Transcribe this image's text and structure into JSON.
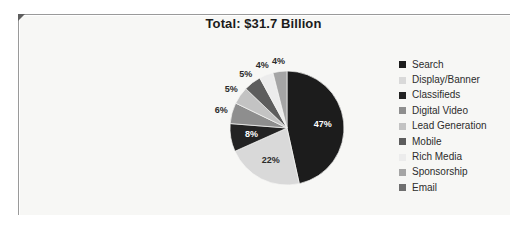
{
  "panel": {
    "background_color": "#f7f7f5",
    "page_background": "#ffffff"
  },
  "chart_data": {
    "type": "pie",
    "title": "Total: $31.7 Billion",
    "subtitle": "",
    "xlabel": "",
    "ylabel": "",
    "grid": false,
    "legend_position": "right",
    "start_angle_deg": 0,
    "direction": "clockwise",
    "categories": [
      "Search",
      "Display/Banner",
      "Classifieds",
      "Digital Video",
      "Lead Generation",
      "Mobile",
      "Rich Media",
      "Sponsorship",
      "Email"
    ],
    "values": [
      47,
      22,
      8,
      6,
      5,
      5,
      4,
      4,
      0
    ],
    "value_labels": [
      "47%",
      "22%",
      "8%",
      "6%",
      "5%",
      "5%",
      "4%",
      "4%",
      ""
    ],
    "colors": [
      "#1c1c1c",
      "#d9d9d9",
      "#232323",
      "#8e8e8e",
      "#c3c3c3",
      "#5d5d5d",
      "#ececec",
      "#a5a5a5",
      "#6f6f6f"
    ],
    "label_text_colors": [
      "#ffffff",
      "#2b2b2b",
      "#ffffff",
      "#ffffff",
      "#2b2b2b",
      "#ffffff",
      "#2b2b2b",
      "#2b2b2b",
      "#2b2b2b"
    ]
  },
  "legend": {
    "items": [
      {
        "label": "Search",
        "color": "#1c1c1c"
      },
      {
        "label": "Display/Banner",
        "color": "#d9d9d9"
      },
      {
        "label": "Classifieds",
        "color": "#232323"
      },
      {
        "label": "Digital Video",
        "color": "#8e8e8e"
      },
      {
        "label": "Lead Generation",
        "color": "#c3c3c3"
      },
      {
        "label": "Mobile",
        "color": "#5d5d5d"
      },
      {
        "label": "Rich Media",
        "color": "#ececec"
      },
      {
        "label": "Sponsorship",
        "color": "#a5a5a5"
      },
      {
        "label": "Email",
        "color": "#6f6f6f"
      }
    ]
  }
}
